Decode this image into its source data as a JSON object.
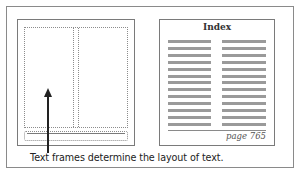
{
  "caption": "Text frames determine the layout of text.",
  "left_page": {
    "description": "page layout with dotted text frames",
    "frames": [
      "main-two-column-frame",
      "footer-frame"
    ],
    "arrow": "points up at main text frame"
  },
  "right_page": {
    "title": "Index",
    "columns": 2,
    "rows_per_column": 13,
    "page_number": "page 765"
  },
  "colors": {
    "border": "#7a7a7a",
    "dotted": "#8c8c8c",
    "text_lines": "#9a9a9a",
    "arrow": "#222222"
  }
}
